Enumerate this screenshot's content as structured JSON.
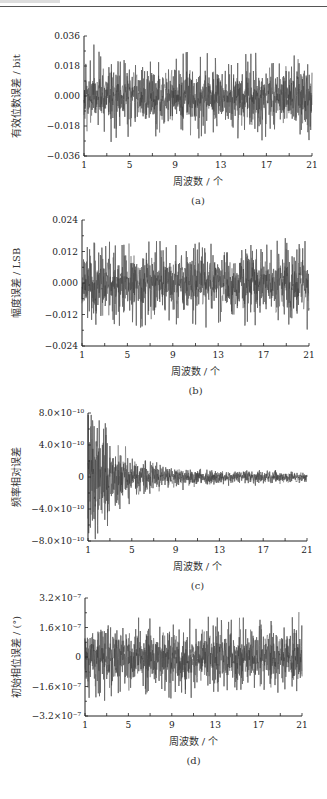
{
  "chart_data": [
    {
      "id": "a",
      "type": "line",
      "caption": "(a)",
      "title": "",
      "xlabel": "周波数 / 个",
      "ylabel": "有效位数误差 / bit",
      "x_ticks": [
        1,
        5,
        9,
        13,
        17,
        21
      ],
      "x_tick_labels": [
        "1",
        "5",
        "9",
        "13",
        "17",
        "21"
      ],
      "y_ticks": [
        0.036,
        0.018,
        0.0,
        -0.018,
        -0.036
      ],
      "y_tick_labels": [
        "0.036",
        "0.018",
        "0.000",
        "−0.018",
        "−0.036"
      ],
      "xlim": [
        1,
        21
      ],
      "ylim": [
        -0.036,
        0.036
      ],
      "grid": false,
      "legend": null,
      "series": [
        {
          "name": "error",
          "envelope": "constant",
          "band_halfwidth": 0.014,
          "peak": 0.026,
          "trough": -0.03
        }
      ],
      "layout": {
        "x0": 84,
        "x1": 312,
        "ytop": 36,
        "ybot": 156,
        "seed": 11
      }
    },
    {
      "id": "b",
      "type": "line",
      "caption": "(b)",
      "title": "",
      "xlabel": "周波数 / 个",
      "ylabel": "幅度误差 / LSB",
      "x_ticks": [
        1,
        5,
        9,
        13,
        17,
        21
      ],
      "x_tick_labels": [
        "1",
        "5",
        "9",
        "13",
        "17",
        "21"
      ],
      "y_ticks": [
        0.024,
        0.012,
        0.0,
        -0.012,
        -0.024
      ],
      "y_tick_labels": [
        "0.024",
        "0.012",
        "0.000",
        "−0.012",
        "−0.024"
      ],
      "xlim": [
        1,
        21
      ],
      "ylim": [
        -0.024,
        0.024
      ],
      "grid": false,
      "legend": null,
      "series": [
        {
          "name": "error",
          "envelope": "constant",
          "band_halfwidth": 0.009,
          "peak": 0.02,
          "trough": -0.022
        }
      ],
      "layout": {
        "x0": 82,
        "x1": 309,
        "ytop": 220,
        "ybot": 346,
        "seed": 23
      }
    },
    {
      "id": "c",
      "type": "line",
      "caption": "(c)",
      "title": "",
      "xlabel": "周波数 / 个",
      "ylabel": "频率相对误差",
      "x_ticks": [
        1,
        5,
        9,
        13,
        17,
        21
      ],
      "x_tick_labels": [
        "1",
        "5",
        "9",
        "13",
        "17",
        "21"
      ],
      "y_ticks": [
        8e-10,
        4e-10,
        0,
        -4e-10,
        -8e-10
      ],
      "y_tick_labels": [
        "8.0×10⁻¹⁰",
        "4.0×10⁻¹⁰",
        "0",
        "−4.0×10⁻¹⁰",
        "−8.0×10⁻¹⁰"
      ],
      "xlim": [
        1,
        21
      ],
      "ylim": [
        -8e-10,
        8e-10
      ],
      "grid": false,
      "legend": null,
      "series": [
        {
          "name": "error",
          "envelope": "decaying",
          "initial_amplitude": 8e-10,
          "final_amplitude": 6e-11
        }
      ],
      "layout": {
        "x0": 88,
        "x1": 307,
        "ytop": 413,
        "ybot": 541,
        "seed": 37
      }
    },
    {
      "id": "d",
      "type": "line",
      "caption": "(d)",
      "title": "",
      "xlabel": "周波数 / 个",
      "ylabel": "初始相位误差 / (°)",
      "x_ticks": [
        1,
        5,
        9,
        13,
        17,
        21
      ],
      "x_tick_labels": [
        "1",
        "5",
        "9",
        "13",
        "17",
        "21"
      ],
      "y_ticks": [
        3.2e-07,
        1.6e-07,
        0,
        -1.6e-07,
        -3.2e-07
      ],
      "y_tick_labels": [
        "3.2×10⁻⁷",
        "1.6×10⁻⁷",
        "0",
        "−1.6×10⁻⁷",
        "−3.2×10⁻⁷"
      ],
      "xlim": [
        1,
        21
      ],
      "ylim": [
        -3.2e-07,
        3.2e-07
      ],
      "grid": false,
      "legend": null,
      "series": [
        {
          "name": "error",
          "envelope": "constant",
          "band_halfwidth": 1.2e-07,
          "peak": 2.7e-07,
          "trough": -2.5e-07
        }
      ],
      "layout": {
        "x0": 85,
        "x1": 302,
        "ytop": 598,
        "ybot": 716,
        "seed": 51
      }
    }
  ],
  "style": {
    "signal_color": "#6a6a6a",
    "signal_dark": "#2e2e2e",
    "axis_color": "#222222"
  }
}
